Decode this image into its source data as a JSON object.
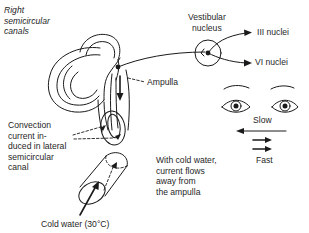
{
  "diagram": {
    "labels": {
      "canals_title": [
        "Right",
        "semicircular",
        "canals"
      ],
      "vestibular_nucleus": [
        "Vestibular",
        "nucleus"
      ],
      "iii_nuclei": "III nuclei",
      "vi_nuclei": "VI nuclei",
      "ampulla": "Ampulla",
      "convection": [
        "Convection",
        "current in-",
        "duced in lateral",
        "semicircular",
        "canal"
      ],
      "slow": "Slow",
      "fast": "Fast",
      "cold_water_note": [
        "With cold water,",
        "current flows",
        "away from",
        "the ampulla"
      ],
      "cold_water": "Cold water (30°C)"
    },
    "nystagmus": {
      "slow_direction": "left",
      "fast_direction": "right"
    },
    "colors": {
      "ink": "#1a1a1a",
      "background": "#ffffff"
    }
  }
}
